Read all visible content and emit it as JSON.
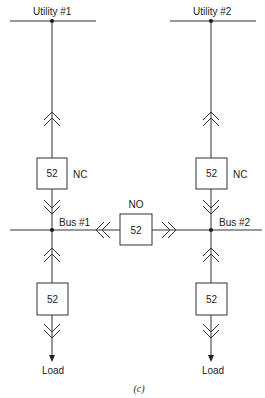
{
  "diagram": {
    "type": "one-line electrical diagram",
    "caption": "(c)",
    "sources": [
      {
        "id": "utility1",
        "label": "Utility #1"
      },
      {
        "id": "utility2",
        "label": "Utility #2"
      }
    ],
    "buses": [
      {
        "id": "bus1",
        "label": "Bus #1"
      },
      {
        "id": "bus2",
        "label": "Bus #2"
      }
    ],
    "breakers": [
      {
        "id": "main1",
        "number": "52",
        "state": "NC",
        "connects": [
          "utility1",
          "bus1"
        ],
        "drawout": true
      },
      {
        "id": "main2",
        "number": "52",
        "state": "NC",
        "connects": [
          "utility2",
          "bus2"
        ],
        "drawout": true
      },
      {
        "id": "tie",
        "number": "52",
        "state": "NO",
        "connects": [
          "bus1",
          "bus2"
        ],
        "drawout": true
      },
      {
        "id": "feeder1",
        "number": "52",
        "state": "",
        "connects": [
          "bus1",
          "load1"
        ],
        "drawout": true
      },
      {
        "id": "feeder2",
        "number": "52",
        "state": "",
        "connects": [
          "bus2",
          "load2"
        ],
        "drawout": true
      }
    ],
    "loads": [
      {
        "id": "load1",
        "label": "Load"
      },
      {
        "id": "load2",
        "label": "Load"
      }
    ]
  },
  "labels": {
    "utility1": "Utility #1",
    "utility2": "Utility #2",
    "bus1": "Bus #1",
    "bus2": "Bus #2",
    "main1_num": "52",
    "main1_state": "NC",
    "main2_num": "52",
    "main2_state": "NC",
    "tie_num": "52",
    "tie_state": "NO",
    "feeder1_num": "52",
    "feeder2_num": "52",
    "load1": "Load",
    "load2": "Load",
    "caption": "(c)"
  },
  "colors": {
    "line": "#333333",
    "background": "#ffffff"
  }
}
